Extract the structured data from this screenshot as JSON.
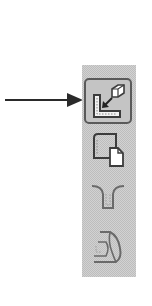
{
  "annotation": {
    "pointer": "arrow-pointing-right",
    "points_to": "toolbar.buttons.0"
  },
  "toolbar": {
    "orientation": "vertical",
    "background": "#d2d2d2",
    "buttons": [
      {
        "icon": "insert-component-icon",
        "state": "active"
      },
      {
        "icon": "copy-sheet-icon",
        "state": "normal"
      },
      {
        "icon": "mold-core-icon",
        "state": "disabled"
      },
      {
        "icon": "bend-feature-icon",
        "state": "disabled"
      }
    ]
  },
  "colors": {
    "arrow": "#2a2a2a",
    "icon_stroke": "#3c3c3c",
    "active_border": "#5a5a5a"
  }
}
